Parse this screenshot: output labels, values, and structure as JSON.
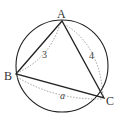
{
  "diagram": {
    "type": "triangle-inscribed-in-circle",
    "circle": {
      "cx": 62,
      "cy": 66,
      "r": 46
    },
    "vertices": {
      "A": {
        "label": "A",
        "x": 62,
        "y": 21
      },
      "B": {
        "label": "B",
        "x": 16,
        "y": 74
      },
      "C": {
        "label": "C",
        "x": 104,
        "y": 98
      }
    },
    "side_labels": {
      "AB": "3",
      "AC": "4",
      "BC": "a"
    },
    "colors": {
      "stroke": "#222222",
      "dashed": "#888888",
      "text": "#333333"
    }
  }
}
